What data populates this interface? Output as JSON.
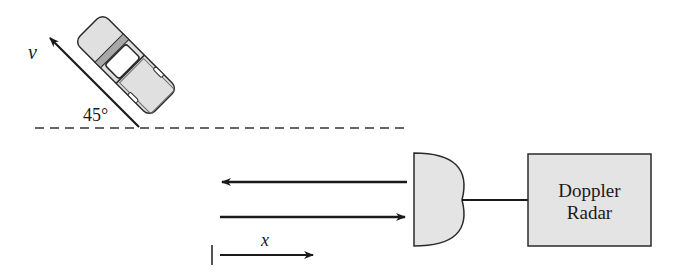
{
  "diagram": {
    "velocity_label": "v",
    "angle_label": "45°",
    "distance_label": "x",
    "radar_label_line1": "Doppler",
    "radar_label_line2": "Radar",
    "colors": {
      "stroke": "#1a1a1a",
      "fill_gray": "#e4e4e4",
      "car_stripe": "#a8a8a8",
      "background": "#ffffff"
    },
    "elements": [
      "car moving at angle 45° to dashed reference line",
      "velocity arrow v",
      "dashed reference line",
      "outgoing radar wave arrow (leftward)",
      "returning radar wave arrow (rightward)",
      "distance arrow x",
      "radar dish antenna",
      "Doppler Radar box"
    ]
  }
}
